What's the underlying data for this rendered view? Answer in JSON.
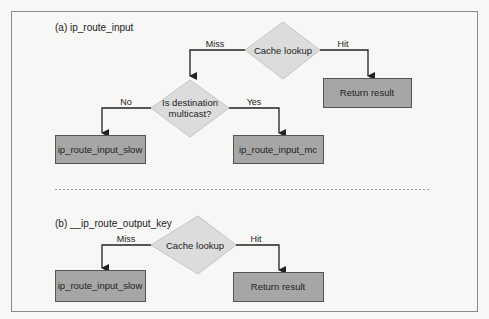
{
  "colors": {
    "background": "#f7f7f5",
    "frame": "#8a8a8a",
    "box_fill": "#a6a6a6",
    "box_stroke": "#555555",
    "diamond_fill": "#dcdcdc",
    "diamond_stroke": "#c4c4c4",
    "edge": "#222222",
    "separator": "#9a9a9a"
  },
  "panel_a": {
    "title": "(a) ip_route_input",
    "decision_cache": "Cache lookup",
    "decision_multicast_line1": "Is destination",
    "decision_multicast_line2": "multicast?",
    "edge_miss": "Miss",
    "edge_hit": "Hit",
    "edge_no": "No",
    "edge_yes": "Yes",
    "box_return": "Return result",
    "box_slow": "ip_route_input_slow",
    "box_mc": "ip_route_input_mc"
  },
  "panel_b": {
    "title": "(b) __ip_route_output_key",
    "decision_cache": "Cache lookup",
    "edge_miss": "Miss",
    "edge_hit": "Hit",
    "box_slow": "ip_route_input_slow",
    "box_return": "Return result"
  }
}
